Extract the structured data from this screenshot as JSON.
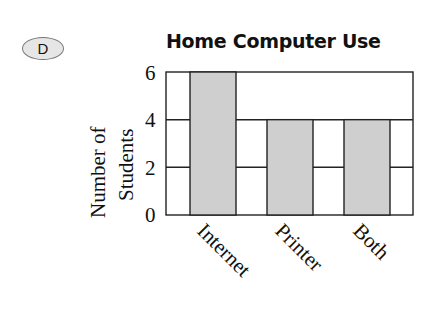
{
  "option_label": "D",
  "chart_data": {
    "type": "bar",
    "title": "Home Computer Use",
    "categories": [
      "Internet",
      "Printer",
      "Both"
    ],
    "values": [
      6,
      4,
      4
    ],
    "xlabel": "",
    "ylabel": "Number of Students",
    "ylabel_lines": [
      "Number of",
      "Students"
    ],
    "yticks": [
      "0",
      "2",
      "4",
      "6"
    ],
    "ylim": [
      0,
      6
    ],
    "grid": true,
    "bar_color": "#cfcfcf",
    "legend": null
  }
}
